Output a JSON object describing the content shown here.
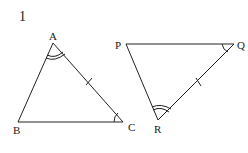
{
  "question_number": "1",
  "triangles": [
    {
      "name": "ABC",
      "vertices": {
        "A": [
          53,
          43
        ],
        "B": [
          18,
          122
        ],
        "C": [
          123,
          122
        ]
      },
      "labels": {
        "A": "A",
        "B": "B",
        "C": "C"
      },
      "marks": {
        "double_arc_angle": "A",
        "single_arc_angle": "C",
        "tick_side": "AC"
      }
    },
    {
      "name": "PQR",
      "vertices": {
        "P": [
          126,
          44
        ],
        "Q": [
          234,
          44
        ],
        "R": [
          158,
          120
        ]
      },
      "labels": {
        "P": "P",
        "Q": "Q",
        "R": "R"
      },
      "marks": {
        "double_arc_angle": "R",
        "single_arc_angle": "Q",
        "tick_side": "QR"
      }
    }
  ],
  "colors": {
    "line": "#222222",
    "background": "#ffffff"
  }
}
